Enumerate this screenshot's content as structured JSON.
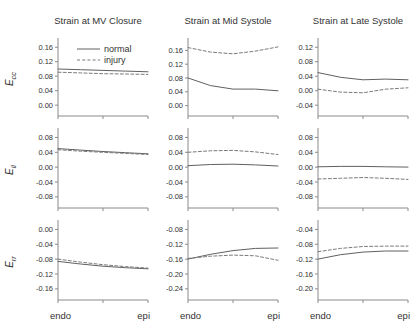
{
  "figure": {
    "col_titles": [
      "Strain at MV Closure",
      "Strain at Mid Systole",
      "Strain at Late Systole"
    ],
    "row_labels": [
      {
        "base": "E",
        "sub": "cc"
      },
      {
        "base": "E",
        "sub": "ll"
      },
      {
        "base": "E",
        "sub": "rr"
      }
    ],
    "x_axis_labels": {
      "left": "endo",
      "right": "epi"
    },
    "legend": {
      "entries": [
        {
          "label": "normal",
          "style": "solid"
        },
        {
          "label": "injury",
          "style": "dashed"
        }
      ]
    },
    "colors": {
      "normal_line": "#606060",
      "injury_line": "#7a7a7a",
      "axis": "#8a8a8a",
      "text": "#333333"
    }
  },
  "chart_data": [
    {
      "type": "line",
      "row": 0,
      "col": 0,
      "title": "Strain at MV Closure",
      "row_label": "E_cc",
      "legend": true,
      "x": [
        0,
        0.25,
        0.5,
        0.75,
        1
      ],
      "yticks": [
        0.16,
        0.12,
        0.08,
        0.04,
        0.0
      ],
      "ylim": [
        -0.03,
        0.18
      ],
      "series": [
        {
          "name": "normal",
          "style": "solid",
          "values": [
            0.1,
            0.098,
            0.096,
            0.094,
            0.092
          ]
        },
        {
          "name": "injury",
          "style": "dashed",
          "values": [
            0.091,
            0.089,
            0.087,
            0.086,
            0.085
          ]
        }
      ]
    },
    {
      "type": "line",
      "row": 0,
      "col": 1,
      "title": "Strain at Mid Systole",
      "row_label": "E_cc",
      "legend": false,
      "x": [
        0,
        0.25,
        0.5,
        0.75,
        1
      ],
      "yticks": [
        0.16,
        0.12,
        0.08,
        0.04,
        0.0
      ],
      "ylim": [
        -0.03,
        0.19
      ],
      "series": [
        {
          "name": "normal",
          "style": "solid",
          "values": [
            0.08,
            0.058,
            0.048,
            0.048,
            0.043
          ]
        },
        {
          "name": "injury",
          "style": "dashed",
          "values": [
            0.168,
            0.155,
            0.15,
            0.158,
            0.17
          ]
        }
      ]
    },
    {
      "type": "line",
      "row": 0,
      "col": 2,
      "title": "Strain at Late Systole",
      "row_label": "E_cc",
      "legend": false,
      "x": [
        0,
        0.25,
        0.5,
        0.75,
        1
      ],
      "yticks": [
        0.12,
        0.08,
        0.04,
        0.0,
        -0.04
      ],
      "ylim": [
        -0.07,
        0.14
      ],
      "series": [
        {
          "name": "normal",
          "style": "solid",
          "values": [
            0.05,
            0.037,
            0.03,
            0.032,
            0.03
          ]
        },
        {
          "name": "injury",
          "style": "dashed",
          "values": [
            0.004,
            -0.004,
            -0.006,
            0.004,
            0.008
          ]
        }
      ]
    },
    {
      "type": "line",
      "row": 1,
      "col": 0,
      "title": "Strain at MV Closure",
      "row_label": "E_ll",
      "legend": false,
      "x": [
        0,
        0.25,
        0.5,
        0.75,
        1
      ],
      "yticks": [
        0.08,
        0.04,
        0.0,
        -0.04,
        -0.08
      ],
      "ylim": [
        -0.11,
        0.1
      ],
      "series": [
        {
          "name": "normal",
          "style": "solid",
          "values": [
            0.05,
            0.046,
            0.042,
            0.039,
            0.036
          ]
        },
        {
          "name": "injury",
          "style": "dashed",
          "values": [
            0.047,
            0.043,
            0.04,
            0.037,
            0.034
          ]
        }
      ]
    },
    {
      "type": "line",
      "row": 1,
      "col": 1,
      "title": "Strain at Mid Systole",
      "row_label": "E_ll",
      "legend": false,
      "x": [
        0,
        0.25,
        0.5,
        0.75,
        1
      ],
      "yticks": [
        0.08,
        0.04,
        0.0,
        -0.04,
        -0.08
      ],
      "ylim": [
        -0.11,
        0.1
      ],
      "series": [
        {
          "name": "normal",
          "style": "solid",
          "values": [
            0.004,
            0.007,
            0.008,
            0.006,
            0.003
          ]
        },
        {
          "name": "injury",
          "style": "dashed",
          "values": [
            0.04,
            0.044,
            0.045,
            0.041,
            0.034
          ]
        }
      ]
    },
    {
      "type": "line",
      "row": 1,
      "col": 2,
      "title": "Strain at Late Systole",
      "row_label": "E_ll",
      "legend": false,
      "x": [
        0,
        0.25,
        0.5,
        0.75,
        1
      ],
      "yticks": [
        0.08,
        0.04,
        0.0,
        -0.04,
        -0.08
      ],
      "ylim": [
        -0.11,
        0.1
      ],
      "series": [
        {
          "name": "normal",
          "style": "solid",
          "values": [
            0.001,
            0.002,
            0.002,
            0.001,
            0.0
          ]
        },
        {
          "name": "injury",
          "style": "dashed",
          "values": [
            -0.032,
            -0.03,
            -0.028,
            -0.03,
            -0.033
          ]
        }
      ]
    },
    {
      "type": "line",
      "row": 2,
      "col": 0,
      "title": "Strain at MV Closure",
      "row_label": "E_rr",
      "legend": false,
      "x": [
        0,
        0.25,
        0.5,
        0.75,
        1
      ],
      "yticks": [
        0.0,
        -0.04,
        -0.08,
        -0.12,
        -0.16
      ],
      "ylim": [
        -0.19,
        0.02
      ],
      "series": [
        {
          "name": "normal",
          "style": "solid",
          "values": [
            -0.086,
            -0.093,
            -0.099,
            -0.103,
            -0.106
          ]
        },
        {
          "name": "injury",
          "style": "dashed",
          "values": [
            -0.08,
            -0.088,
            -0.095,
            -0.1,
            -0.104
          ]
        }
      ]
    },
    {
      "type": "line",
      "row": 2,
      "col": 1,
      "title": "Strain at Mid Systole",
      "row_label": "E_rr",
      "legend": false,
      "x": [
        0,
        0.25,
        0.5,
        0.75,
        1
      ],
      "yticks": [
        -0.08,
        -0.12,
        -0.16,
        -0.2,
        -0.24
      ],
      "ylim": [
        -0.27,
        -0.06
      ],
      "series": [
        {
          "name": "normal",
          "style": "solid",
          "values": [
            -0.16,
            -0.147,
            -0.137,
            -0.131,
            -0.13
          ]
        },
        {
          "name": "injury",
          "style": "dashed",
          "values": [
            -0.158,
            -0.152,
            -0.149,
            -0.151,
            -0.163
          ]
        }
      ]
    },
    {
      "type": "line",
      "row": 2,
      "col": 2,
      "title": "Strain at Late Systole",
      "row_label": "E_rr",
      "legend": false,
      "x": [
        0,
        0.25,
        0.5,
        0.75,
        1
      ],
      "yticks": [
        -0.04,
        -0.08,
        -0.12,
        -0.16,
        -0.2
      ],
      "ylim": [
        -0.23,
        -0.02
      ],
      "series": [
        {
          "name": "normal",
          "style": "solid",
          "values": [
            -0.12,
            -0.108,
            -0.101,
            -0.098,
            -0.098
          ]
        },
        {
          "name": "injury",
          "style": "dashed",
          "values": [
            -0.1,
            -0.091,
            -0.086,
            -0.085,
            -0.085
          ]
        }
      ]
    }
  ]
}
